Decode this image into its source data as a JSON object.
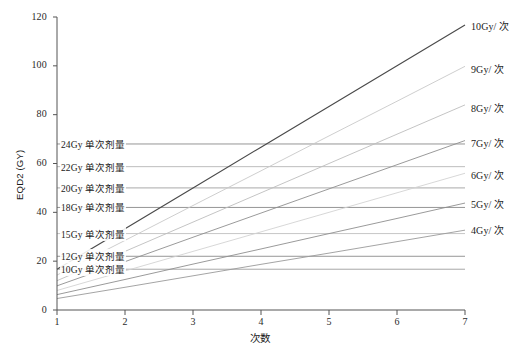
{
  "chart_data": {
    "type": "line",
    "title": "",
    "xlabel": "次数",
    "ylabel": "EQD2 (GY)",
    "xlim": [
      1,
      7
    ],
    "ylim": [
      0,
      120
    ],
    "grid": false,
    "legend_position": "right-outside",
    "x": [
      1,
      2,
      3,
      4,
      5,
      6,
      7
    ],
    "xticks": [
      "1",
      "2",
      "3",
      "4",
      "5",
      "6",
      "7"
    ],
    "yticks": [
      "0",
      "20",
      "40",
      "60",
      "80",
      "100",
      "120"
    ],
    "series": [
      {
        "name": "10Gy/ 次",
        "color": "#4a4a4a",
        "values": [
          16.7,
          33.3,
          50.0,
          66.7,
          83.3,
          100.0,
          116.7
        ]
      },
      {
        "name": "9Gy/ 次",
        "color": "#c8c8c8",
        "values": [
          14.3,
          28.5,
          42.8,
          57.0,
          71.3,
          85.5,
          99.8
        ]
      },
      {
        "name": "8Gy/ 次",
        "color": "#bdbdbd",
        "values": [
          12.0,
          24.0,
          36.0,
          48.0,
          60.0,
          72.0,
          84.0
        ]
      },
      {
        "name": "7Gy/ 次",
        "color": "#8e8e8e",
        "values": [
          9.9,
          19.8,
          29.8,
          39.7,
          49.6,
          59.5,
          69.4
        ]
      },
      {
        "name": "6Gy/ 次",
        "color": "#d2d2d2",
        "values": [
          8.0,
          16.0,
          24.0,
          32.0,
          40.0,
          48.0,
          56.0
        ]
      },
      {
        "name": "5Gy/ 次",
        "color": "#8e8e8e",
        "values": [
          6.3,
          12.5,
          18.8,
          25.0,
          31.3,
          37.5,
          43.8
        ]
      },
      {
        "name": "4Gy/ 次",
        "color": "#9a9a9a",
        "values": [
          4.7,
          9.3,
          14.0,
          18.7,
          23.3,
          28.0,
          32.7
        ]
      }
    ],
    "reference_lines": [
      {
        "label": "24Gy 单次剂量",
        "value": 68.0,
        "color": "#8a8a8a"
      },
      {
        "label": "22Gy 单次剂量",
        "value": 58.7,
        "color": "#b5b5b5"
      },
      {
        "label": "20Gy 单次剂量",
        "value": 50.0,
        "color": "#9e9e9e"
      },
      {
        "label": "18Gy 单次剂量",
        "value": 42.0,
        "color": "#8a8a8a"
      },
      {
        "label": "15Gy 单次剂量",
        "value": 31.3,
        "color": "#c0c0c0"
      },
      {
        "label": "12Gy 单次剂量",
        "value": 22.0,
        "color": "#8a8a8a"
      },
      {
        "label": "10Gy 单次剂量",
        "value": 16.7,
        "color": "#9e9e9e"
      }
    ]
  },
  "axis": {
    "y_title": "EQD2 (GY)",
    "x_title": "次数"
  }
}
